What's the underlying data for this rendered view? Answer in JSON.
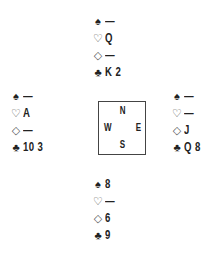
{
  "suits": {
    "spades": "♠",
    "hearts": "♡",
    "diamonds": "◇",
    "clubs": "♣"
  },
  "hands": {
    "north": {
      "spades": "—",
      "hearts": "Q",
      "diamonds": "—",
      "clubs": "K 2"
    },
    "west": {
      "spades": "—",
      "hearts": "A",
      "diamonds": "—",
      "clubs": "10 3"
    },
    "east": {
      "spades": "—",
      "hearts": "—",
      "diamonds": "J",
      "clubs": "Q 8"
    },
    "south": {
      "spades": "8",
      "hearts": "—",
      "diamonds": "6",
      "clubs": "9"
    }
  },
  "compass": {
    "north": "N",
    "west": "W",
    "east": "E",
    "south": "S"
  }
}
